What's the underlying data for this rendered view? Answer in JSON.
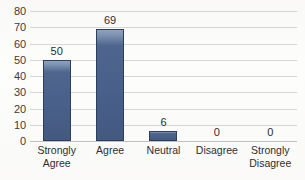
{
  "chart_data": {
    "type": "bar",
    "title": "",
    "xlabel": "",
    "ylabel": "",
    "categories": [
      "Strongly Agree",
      "Agree",
      "Neutral",
      "Disagree",
      "Strongly Disagree"
    ],
    "category_lines": [
      [
        "Strongly",
        "Agree"
      ],
      [
        "Agree",
        ""
      ],
      [
        "Neutral",
        ""
      ],
      [
        "Disagree",
        ""
      ],
      [
        "Strongly",
        "Disagree"
      ]
    ],
    "values": [
      50,
      69,
      6,
      0,
      0
    ],
    "data_labels": [
      "50",
      "69",
      "6",
      "0",
      "0"
    ],
    "ylim": [
      0,
      80
    ],
    "ytick_step": 10,
    "yticks": [
      80,
      70,
      60,
      50,
      40,
      30,
      20,
      10,
      0
    ],
    "ytick_labels": [
      "80",
      "70",
      "60",
      "50",
      "40",
      "30",
      "20",
      "10",
      "0"
    ],
    "grid": true,
    "legend": false,
    "legend_position": "none",
    "colors": {
      "bar_fill": "#48608a",
      "bar_highlight": "#8fa2bd",
      "bar_border": "#2c3f5e",
      "gridline": "#d6d6d6",
      "axis": "#c0c0c0",
      "text": "#2e2e2e",
      "background": "#fdfdfc"
    }
  }
}
